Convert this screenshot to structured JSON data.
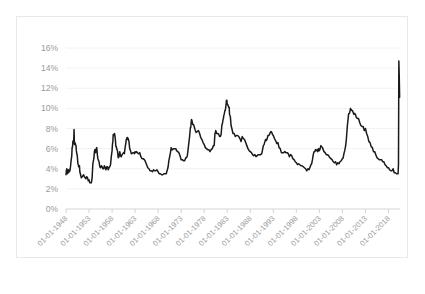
{
  "chart_data": {
    "type": "line",
    "title": "",
    "xlabel": "",
    "ylabel": "",
    "ylim": [
      0,
      16
    ],
    "ytick_labels": [
      "0%",
      "2%",
      "4%",
      "6%",
      "8%",
      "10%",
      "12%",
      "14%",
      "16%"
    ],
    "ytick_values": [
      0,
      2,
      4,
      6,
      8,
      10,
      12,
      14,
      16
    ],
    "xtick_labels": [
      "01-01-1948",
      "01-01-1953",
      "01-01-1958",
      "01-01-1963",
      "01-01-1968",
      "01-01-1973",
      "01-01-1978",
      "01-01-1983",
      "01-01-1988",
      "01-01-1993",
      "01-01-1998",
      "01-01-2003",
      "01-01-2008",
      "01-01-2013",
      "01-01-2018"
    ],
    "xtick_years": [
      1948,
      1953,
      1958,
      1963,
      1968,
      1973,
      1978,
      1983,
      1988,
      1993,
      1998,
      2003,
      2008,
      2013,
      2018
    ],
    "xlim_years": [
      1948,
      2020.5
    ],
    "grid": "horizontal",
    "legend": "none",
    "series": [
      {
        "name": "Unemployment Rate",
        "color": "#1a1a1a",
        "x": [
          1948.0,
          1948.08,
          1948.17,
          1948.25,
          1948.33,
          1948.42,
          1948.5,
          1948.58,
          1948.67,
          1948.75,
          1948.83,
          1948.92,
          1949.0,
          1949.08,
          1949.17,
          1949.25,
          1949.33,
          1949.42,
          1949.5,
          1949.58,
          1949.67,
          1949.75,
          1949.83,
          1949.92,
          1950.0,
          1950.08,
          1950.17,
          1950.25,
          1950.33,
          1950.42,
          1950.5,
          1950.58,
          1950.67,
          1950.75,
          1950.83,
          1950.92,
          1951.0,
          1951.17,
          1951.33,
          1951.5,
          1951.67,
          1951.83,
          1952.0,
          1952.17,
          1952.33,
          1952.5,
          1952.67,
          1952.83,
          1953.0,
          1953.17,
          1953.33,
          1953.5,
          1953.67,
          1953.83,
          1954.0,
          1954.08,
          1954.17,
          1954.25,
          1954.33,
          1954.42,
          1954.5,
          1954.58,
          1954.67,
          1954.75,
          1954.83,
          1954.92,
          1955.0,
          1955.17,
          1955.33,
          1955.5,
          1955.67,
          1955.83,
          1956.0,
          1956.17,
          1956.33,
          1956.5,
          1956.67,
          1956.83,
          1957.0,
          1957.17,
          1957.33,
          1957.5,
          1957.67,
          1957.83,
          1958.0,
          1958.08,
          1958.17,
          1958.25,
          1958.33,
          1958.42,
          1958.5,
          1958.58,
          1958.67,
          1958.75,
          1958.83,
          1958.92,
          1959.0,
          1959.17,
          1959.33,
          1959.5,
          1959.67,
          1959.83,
          1960.0,
          1960.17,
          1960.33,
          1960.5,
          1960.67,
          1960.83,
          1961.0,
          1961.08,
          1961.17,
          1961.25,
          1961.33,
          1961.42,
          1961.5,
          1961.67,
          1961.83,
          1962.0,
          1962.17,
          1962.33,
          1962.5,
          1962.67,
          1962.83,
          1963.0,
          1963.17,
          1963.33,
          1963.5,
          1963.67,
          1963.83,
          1964.0,
          1964.25,
          1964.5,
          1964.75,
          1965.0,
          1965.25,
          1965.5,
          1965.75,
          1966.0,
          1966.25,
          1966.5,
          1966.75,
          1967.0,
          1967.25,
          1967.5,
          1967.75,
          1968.0,
          1968.25,
          1968.5,
          1968.75,
          1969.0,
          1969.25,
          1969.5,
          1969.75,
          1970.0,
          1970.17,
          1970.33,
          1970.5,
          1970.67,
          1970.83,
          1971.0,
          1971.17,
          1971.33,
          1971.5,
          1971.67,
          1971.83,
          1972.0,
          1972.25,
          1972.5,
          1972.75,
          1973.0,
          1973.25,
          1973.5,
          1973.75,
          1974.0,
          1974.17,
          1974.33,
          1974.5,
          1974.67,
          1974.83,
          1975.0,
          1975.08,
          1975.17,
          1975.25,
          1975.33,
          1975.42,
          1975.5,
          1975.67,
          1975.83,
          1976.0,
          1976.25,
          1976.5,
          1976.75,
          1977.0,
          1977.25,
          1977.5,
          1977.75,
          1978.0,
          1978.25,
          1978.5,
          1978.75,
          1979.0,
          1979.25,
          1979.5,
          1979.75,
          1980.0,
          1980.17,
          1980.25,
          1980.33,
          1980.42,
          1980.5,
          1980.58,
          1980.67,
          1980.83,
          1981.0,
          1981.17,
          1981.33,
          1981.5,
          1981.67,
          1981.83,
          1982.0,
          1982.08,
          1982.17,
          1982.25,
          1982.33,
          1982.42,
          1982.5,
          1982.58,
          1982.67,
          1982.75,
          1982.83,
          1982.92,
          1983.0,
          1983.08,
          1983.17,
          1983.25,
          1983.33,
          1983.42,
          1983.5,
          1983.67,
          1983.83,
          1984.0,
          1984.25,
          1984.5,
          1984.75,
          1985.0,
          1985.25,
          1985.5,
          1985.75,
          1986.0,
          1986.25,
          1986.5,
          1986.75,
          1987.0,
          1987.25,
          1987.5,
          1987.75,
          1988.0,
          1988.25,
          1988.5,
          1988.75,
          1989.0,
          1989.25,
          1989.5,
          1989.75,
          1990.0,
          1990.25,
          1990.5,
          1990.67,
          1990.83,
          1991.0,
          1991.17,
          1991.33,
          1991.5,
          1991.67,
          1991.83,
          1992.0,
          1992.17,
          1992.33,
          1992.5,
          1992.67,
          1992.83,
          1993.0,
          1993.25,
          1993.5,
          1993.75,
          1994.0,
          1994.25,
          1994.5,
          1994.75,
          1995.0,
          1995.25,
          1995.5,
          1995.75,
          1996.0,
          1996.25,
          1996.5,
          1996.75,
          1997.0,
          1997.25,
          1997.5,
          1997.75,
          1998.0,
          1998.25,
          1998.5,
          1998.75,
          1999.0,
          1999.25,
          1999.5,
          1999.75,
          2000.0,
          2000.25,
          2000.5,
          2000.75,
          2001.0,
          2001.17,
          2001.33,
          2001.5,
          2001.67,
          2001.83,
          2002.0,
          2002.17,
          2002.33,
          2002.5,
          2002.67,
          2002.83,
          2003.0,
          2003.17,
          2003.33,
          2003.5,
          2003.67,
          2003.83,
          2004.0,
          2004.25,
          2004.5,
          2004.75,
          2005.0,
          2005.25,
          2005.5,
          2005.75,
          2006.0,
          2006.25,
          2006.5,
          2006.75,
          2007.0,
          2007.25,
          2007.5,
          2007.75,
          2008.0,
          2008.17,
          2008.33,
          2008.5,
          2008.67,
          2008.83,
          2009.0,
          2009.08,
          2009.17,
          2009.25,
          2009.33,
          2009.42,
          2009.5,
          2009.58,
          2009.67,
          2009.75,
          2009.83,
          2009.92,
          2010.0,
          2010.17,
          2010.33,
          2010.5,
          2010.67,
          2010.83,
          2011.0,
          2011.25,
          2011.5,
          2011.75,
          2012.0,
          2012.25,
          2012.5,
          2012.75,
          2013.0,
          2013.25,
          2013.5,
          2013.75,
          2014.0,
          2014.25,
          2014.5,
          2014.75,
          2015.0,
          2015.25,
          2015.5,
          2015.75,
          2016.0,
          2016.25,
          2016.5,
          2016.75,
          2017.0,
          2017.25,
          2017.5,
          2017.75,
          2018.0,
          2018.25,
          2018.5,
          2018.75,
          2019.0,
          2019.25,
          2019.5,
          2019.75,
          2020.0,
          2020.08,
          2020.17,
          2020.25,
          2020.33,
          2020.42
        ],
        "y": [
          3.4,
          3.8,
          4.0,
          3.9,
          3.5,
          3.6,
          3.6,
          3.9,
          3.8,
          3.7,
          3.8,
          4.0,
          4.3,
          4.7,
          5.0,
          5.3,
          6.1,
          6.2,
          6.7,
          6.8,
          6.6,
          7.9,
          6.4,
          6.6,
          6.5,
          6.4,
          6.3,
          5.8,
          5.5,
          5.4,
          5.0,
          4.5,
          4.4,
          4.2,
          4.2,
          4.3,
          3.7,
          3.4,
          3.1,
          3.2,
          3.3,
          3.4,
          3.2,
          3.1,
          3.0,
          3.2,
          3.1,
          2.8,
          2.9,
          2.6,
          2.6,
          2.6,
          3.1,
          4.5,
          4.9,
          5.2,
          5.7,
          5.9,
          5.9,
          5.6,
          5.8,
          6.0,
          6.1,
          5.7,
          5.3,
          5.0,
          4.9,
          4.7,
          4.2,
          4.1,
          4.3,
          4.2,
          4.0,
          4.0,
          4.3,
          4.1,
          3.9,
          4.2,
          4.2,
          3.9,
          4.1,
          4.2,
          4.4,
          5.2,
          5.8,
          6.4,
          6.7,
          7.4,
          7.4,
          7.3,
          7.5,
          7.4,
          7.1,
          6.7,
          6.2,
          6.2,
          6.0,
          5.8,
          5.1,
          5.2,
          5.7,
          5.3,
          5.2,
          5.4,
          5.5,
          5.6,
          5.5,
          6.1,
          6.6,
          6.9,
          7.0,
          7.1,
          7.1,
          6.9,
          7.0,
          6.7,
          6.0,
          5.8,
          5.5,
          5.5,
          5.6,
          5.6,
          5.5,
          5.7,
          5.6,
          5.7,
          5.6,
          5.5,
          5.5,
          5.6,
          5.2,
          5.0,
          5.0,
          4.9,
          4.7,
          4.4,
          4.1,
          4.0,
          3.8,
          3.8,
          3.7,
          3.9,
          3.8,
          3.8,
          3.9,
          3.7,
          3.5,
          3.5,
          3.4,
          3.4,
          3.5,
          3.5,
          3.5,
          3.9,
          4.2,
          4.8,
          5.2,
          5.6,
          6.1,
          5.9,
          5.9,
          6.0,
          6.0,
          6.0,
          6.0,
          5.8,
          5.7,
          5.6,
          5.3,
          4.9,
          4.9,
          4.8,
          4.8,
          5.1,
          5.1,
          5.3,
          5.9,
          6.6,
          7.2,
          8.1,
          8.1,
          8.6,
          8.9,
          8.8,
          8.6,
          8.4,
          8.4,
          8.2,
          7.9,
          7.6,
          7.7,
          7.8,
          7.5,
          7.1,
          6.9,
          6.6,
          6.4,
          6.1,
          6.0,
          5.9,
          5.9,
          5.7,
          5.9,
          6.0,
          6.3,
          6.3,
          6.9,
          7.5,
          7.6,
          7.8,
          7.7,
          7.5,
          7.5,
          7.5,
          7.4,
          7.2,
          7.2,
          7.4,
          8.3,
          8.6,
          8.9,
          9.0,
          9.3,
          9.4,
          9.6,
          9.8,
          9.8,
          10.1,
          10.4,
          10.8,
          10.8,
          10.4,
          10.4,
          10.3,
          10.2,
          10.1,
          10.1,
          9.4,
          9.2,
          8.3,
          8.0,
          7.5,
          7.5,
          7.2,
          7.3,
          7.3,
          7.2,
          7.0,
          6.7,
          7.2,
          7.0,
          6.9,
          6.6,
          6.3,
          6.0,
          5.8,
          5.7,
          5.6,
          5.4,
          5.3,
          5.4,
          5.2,
          5.3,
          5.4,
          5.4,
          5.4,
          5.5,
          5.9,
          6.3,
          6.4,
          6.7,
          6.9,
          6.8,
          7.0,
          7.3,
          7.3,
          7.4,
          7.6,
          7.7,
          7.6,
          7.4,
          7.3,
          7.0,
          6.8,
          6.5,
          6.6,
          6.1,
          6.0,
          5.6,
          5.6,
          5.6,
          5.7,
          5.6,
          5.6,
          5.5,
          5.2,
          5.4,
          5.3,
          5.0,
          4.9,
          4.7,
          4.6,
          4.4,
          4.5,
          4.4,
          4.3,
          4.3,
          4.2,
          4.1,
          4.0,
          3.8,
          4.0,
          3.9,
          4.2,
          4.4,
          4.5,
          4.9,
          5.4,
          5.7,
          5.7,
          5.9,
          5.8,
          5.9,
          5.7,
          6.0,
          5.8,
          6.0,
          6.3,
          6.2,
          6.1,
          5.9,
          5.7,
          5.6,
          5.4,
          5.4,
          5.3,
          5.1,
          5.0,
          4.9,
          4.7,
          4.6,
          4.7,
          4.4,
          4.6,
          4.5,
          4.7,
          4.8,
          5.0,
          5.1,
          5.5,
          5.8,
          6.2,
          6.8,
          7.8,
          8.3,
          8.7,
          9.0,
          9.4,
          9.5,
          9.5,
          9.6,
          9.8,
          10.0,
          9.9,
          9.9,
          9.8,
          9.8,
          9.6,
          9.4,
          9.5,
          9.4,
          9.1,
          9.0,
          9.0,
          8.6,
          8.3,
          8.2,
          8.2,
          7.8,
          8.0,
          7.5,
          7.2,
          6.7,
          6.6,
          6.2,
          6.1,
          5.7,
          5.7,
          5.4,
          5.1,
          5.0,
          4.9,
          4.9,
          4.9,
          4.7,
          4.7,
          4.4,
          4.3,
          4.1,
          4.1,
          3.9,
          3.8,
          3.8,
          4.0,
          3.6,
          3.6,
          3.5,
          3.5,
          3.5,
          4.4,
          14.7,
          13.3,
          11.1
        ]
      }
    ]
  }
}
